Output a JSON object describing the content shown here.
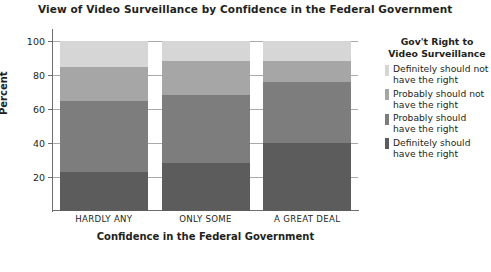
{
  "chart_data": {
    "type": "bar",
    "subtype": "stacked-bar-100",
    "title": "View of Video Surveillance by Confidence in the Federal Government",
    "xlabel": "Confidence in the Federal Government",
    "ylabel": "Percent",
    "categories": [
      "HARDLY ANY",
      "ONLY SOME",
      "A GREAT DEAL"
    ],
    "ylim": [
      0,
      100
    ],
    "yticks": [
      20,
      40,
      60,
      80,
      100
    ],
    "ytick_labels": [
      "20",
      "40",
      "60",
      "80",
      "100"
    ],
    "grid": true,
    "legend_position": "right",
    "legend_title": "Gov't Right to Video Surveillance",
    "series": [
      {
        "name": "Definitely should have the right",
        "color": "#5c5c5c",
        "values": [
          23,
          28,
          40
        ]
      },
      {
        "name": "Probably should have the right",
        "color": "#7d7d7d",
        "values": [
          42,
          40,
          36
        ]
      },
      {
        "name": "Probably should not have the right",
        "color": "#a6a6a6",
        "values": [
          20,
          20,
          12
        ]
      },
      {
        "name": "Definitely should not have the right",
        "color": "#d6d6d6",
        "values": [
          15,
          12,
          12
        ]
      }
    ]
  },
  "legend": {
    "title": "Gov't Right to Video Surveillance",
    "items": [
      {
        "label": "Definitely should not have the right",
        "color": "#d6d6d6"
      },
      {
        "label": "Probably should not have the right",
        "color": "#a6a6a6"
      },
      {
        "label": "Probably should have the right",
        "color": "#7d7d7d"
      },
      {
        "label": "Definitely should have the right",
        "color": "#5c5c5c"
      }
    ]
  }
}
